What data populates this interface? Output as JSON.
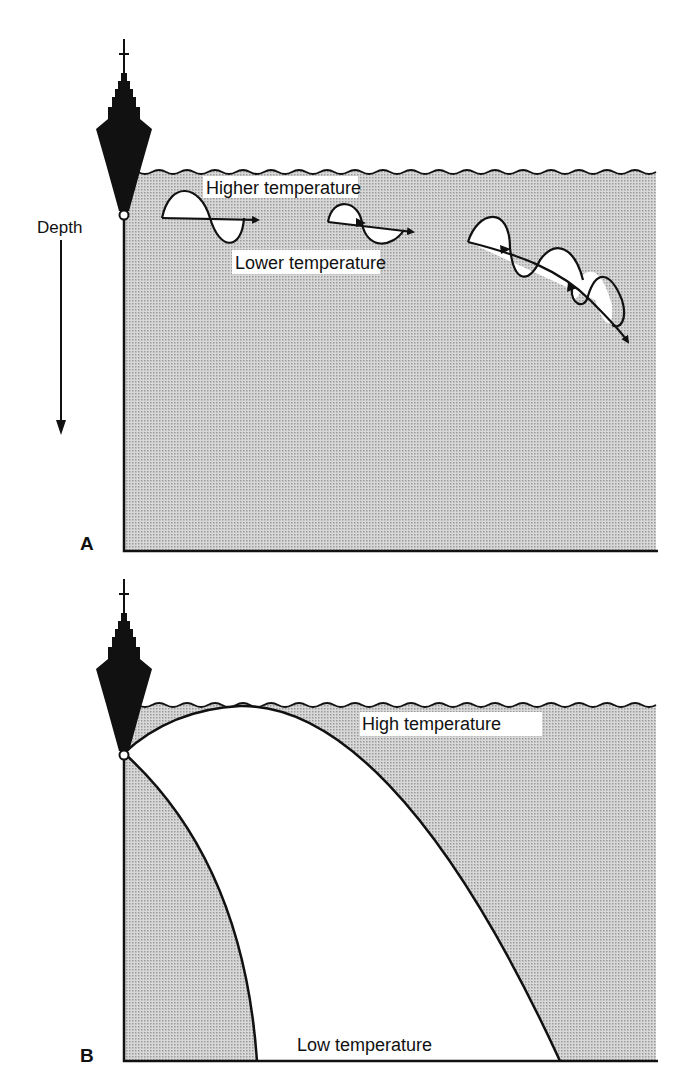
{
  "panel_a": {
    "label": "A",
    "depth_label": "Depth",
    "upper_label": "Higher temperature",
    "lower_label": "Lower temperature"
  },
  "panel_b": {
    "label": "B",
    "upper_label": "High temperature",
    "lower_label": "Low temperature"
  },
  "colors": {
    "water_fill": "#c9c9c9",
    "ink": "#111111",
    "background": "#ffffff"
  }
}
